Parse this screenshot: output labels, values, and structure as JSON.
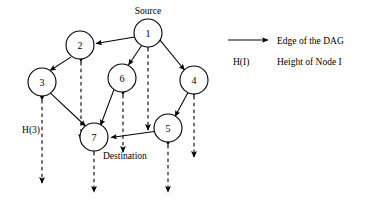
{
  "figure": {
    "title": "",
    "nodes": [
      {
        "id": "1",
        "label": "1",
        "x": 148,
        "y": 33,
        "r": 14
      },
      {
        "id": "2",
        "label": "2",
        "x": 80,
        "y": 45,
        "r": 14
      },
      {
        "id": "3",
        "label": "3",
        "x": 42,
        "y": 82,
        "r": 14
      },
      {
        "id": "4",
        "label": "4",
        "x": 194,
        "y": 80,
        "r": 14
      },
      {
        "id": "5",
        "label": "5",
        "x": 168,
        "y": 128,
        "r": 14
      },
      {
        "id": "6",
        "label": "6",
        "x": 122,
        "y": 78,
        "r": 14
      },
      {
        "id": "7",
        "label": "7",
        "x": 94,
        "y": 137,
        "r": 14
      }
    ],
    "edges": [
      {
        "from": "1",
        "to": "2"
      },
      {
        "from": "2",
        "to": "3"
      },
      {
        "from": "1",
        "to": "4"
      },
      {
        "from": "1",
        "to": "6"
      },
      {
        "from": "3",
        "to": "7"
      },
      {
        "from": "6",
        "to": "7"
      },
      {
        "from": "4",
        "to": "5"
      },
      {
        "from": "5",
        "to": "7"
      }
    ],
    "height_arrows": [
      {
        "node": "3",
        "x": 42,
        "top": 100,
        "bottom": 183
      },
      {
        "node": "2",
        "x": 81,
        "top": 62,
        "bottom": 140
      },
      {
        "node": "7",
        "x": 94,
        "top": 152,
        "bottom": 192
      },
      {
        "node": "6",
        "x": 123,
        "top": 95,
        "bottom": 152
      },
      {
        "node": "1",
        "x": 148,
        "top": 48,
        "bottom": 130
      },
      {
        "node": "5",
        "x": 168,
        "top": 145,
        "bottom": 192
      },
      {
        "node": "4",
        "x": 194,
        "top": 96,
        "bottom": 157
      }
    ],
    "annotations": {
      "source_label": "Source",
      "destination_label": "Destination",
      "height_3_label": "H(3)"
    },
    "legend": {
      "edge_label": "Edge of the DAG",
      "height_symbol": "H(I)",
      "height_label": "Height of Node I"
    },
    "colors": {
      "stroke": "#000000",
      "fill": "#ffffff",
      "background": "#ffffff"
    }
  }
}
